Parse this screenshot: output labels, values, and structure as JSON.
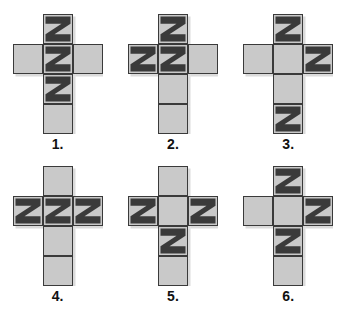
{
  "sheet": {
    "background_color": "#ffffff",
    "face_color": "#c9c9c9",
    "pattern_color": "#3a3a3a",
    "edge_color": "#3a3a3a",
    "net_shape": "latin-cross",
    "cell_count_per_net": 6,
    "pattern_glyph": "Z"
  },
  "figures": [
    {
      "caption": "1.",
      "name": "cross-net-1",
      "faces": [
        {
          "position": "column-row-1",
          "pattern": "Z"
        },
        {
          "position": "arm-left",
          "pattern": "blank"
        },
        {
          "position": "column-row-2",
          "pattern": "Z"
        },
        {
          "position": "arm-right",
          "pattern": "blank"
        },
        {
          "position": "column-row-3",
          "pattern": "Z"
        },
        {
          "position": "column-row-4",
          "pattern": "blank"
        }
      ]
    },
    {
      "caption": "2.",
      "name": "cross-net-2",
      "faces": [
        {
          "position": "column-row-1",
          "pattern": "Z"
        },
        {
          "position": "arm-left",
          "pattern": "Z"
        },
        {
          "position": "column-row-2",
          "pattern": "Z"
        },
        {
          "position": "arm-right",
          "pattern": "blank"
        },
        {
          "position": "column-row-3",
          "pattern": "blank"
        },
        {
          "position": "column-row-4",
          "pattern": "blank"
        }
      ]
    },
    {
      "caption": "3.",
      "name": "cross-net-3",
      "faces": [
        {
          "position": "column-row-1",
          "pattern": "Z"
        },
        {
          "position": "arm-left",
          "pattern": "blank"
        },
        {
          "position": "column-row-2",
          "pattern": "blank"
        },
        {
          "position": "arm-right",
          "pattern": "Z"
        },
        {
          "position": "column-row-3",
          "pattern": "blank"
        },
        {
          "position": "column-row-4",
          "pattern": "Z"
        }
      ]
    },
    {
      "caption": "4.",
      "name": "cross-net-4",
      "faces": [
        {
          "position": "column-row-1",
          "pattern": "blank"
        },
        {
          "position": "arm-left",
          "pattern": "Z"
        },
        {
          "position": "column-row-2",
          "pattern": "Z"
        },
        {
          "position": "arm-right",
          "pattern": "Z"
        },
        {
          "position": "column-row-3",
          "pattern": "blank"
        },
        {
          "position": "column-row-4",
          "pattern": "blank"
        }
      ]
    },
    {
      "caption": "5.",
      "name": "cross-net-5",
      "faces": [
        {
          "position": "column-row-1",
          "pattern": "blank"
        },
        {
          "position": "arm-left",
          "pattern": "Z"
        },
        {
          "position": "column-row-2",
          "pattern": "blank"
        },
        {
          "position": "arm-right",
          "pattern": "Z"
        },
        {
          "position": "column-row-3",
          "pattern": "Z"
        },
        {
          "position": "column-row-4",
          "pattern": "blank"
        }
      ]
    },
    {
      "caption": "6.",
      "name": "cross-net-6",
      "faces": [
        {
          "position": "column-row-1",
          "pattern": "Z"
        },
        {
          "position": "arm-left",
          "pattern": "blank"
        },
        {
          "position": "column-row-2",
          "pattern": "blank"
        },
        {
          "position": "arm-right",
          "pattern": "Z"
        },
        {
          "position": "column-row-3",
          "pattern": "Z"
        },
        {
          "position": "column-row-4",
          "pattern": "blank"
        }
      ]
    }
  ]
}
